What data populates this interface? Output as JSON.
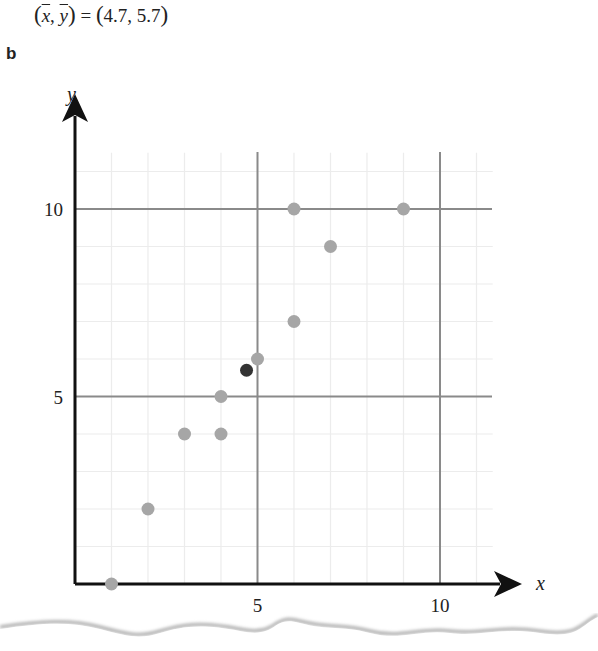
{
  "equation": {
    "lhs_x": "x",
    "lhs_y": "y",
    "equals": "=",
    "rhs": "4.7, 5.7"
  },
  "panel_label": "b",
  "colors": {
    "axis": "#111111",
    "major_grid": "#8a8a8a",
    "minor_grid": "#ececec",
    "point": "#a6a6a6",
    "mean_point": "#333333"
  },
  "chart_data": {
    "type": "scatter",
    "title": "",
    "xlabel": "x",
    "ylabel": "y",
    "xlim": [
      0,
      11.5
    ],
    "ylim": [
      0,
      11.5
    ],
    "grid": true,
    "major_ticks_x": [
      5,
      10
    ],
    "major_ticks_y": [
      5,
      10
    ],
    "tick_labels_x": [
      "5",
      "10"
    ],
    "tick_labels_y": [
      "5",
      "10"
    ],
    "series": [
      {
        "name": "data",
        "points": [
          {
            "x": 1,
            "y": 0
          },
          {
            "x": 2,
            "y": 2
          },
          {
            "x": 3,
            "y": 4
          },
          {
            "x": 4,
            "y": 4
          },
          {
            "x": 4,
            "y": 5
          },
          {
            "x": 5,
            "y": 6
          },
          {
            "x": 6,
            "y": 7
          },
          {
            "x": 6,
            "y": 10
          },
          {
            "x": 7,
            "y": 9
          },
          {
            "x": 9,
            "y": 10
          }
        ]
      },
      {
        "name": "mean",
        "points": [
          {
            "x": 4.7,
            "y": 5.7
          }
        ]
      }
    ],
    "annotations": [
      "(x̄, ȳ) = (4.7, 5.7)"
    ]
  }
}
